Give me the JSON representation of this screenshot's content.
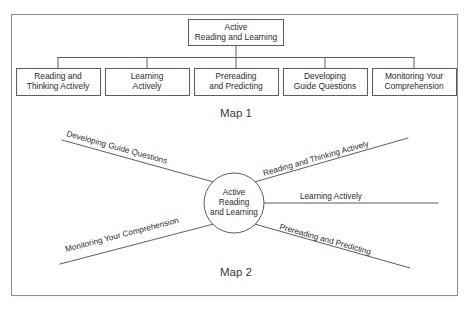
{
  "figure": {
    "background_color": "#ffffff",
    "line_color": "#5d5d5d",
    "frame_color": "#8f8f8f",
    "text_color": "#2b2b2b"
  },
  "map1": {
    "caption": "Map 1",
    "root": {
      "line1": "Active",
      "line2": "Reading and Learning"
    },
    "children": [
      {
        "line1": "Reading and",
        "line2": "Thinking Actively"
      },
      {
        "line1": "Learning",
        "line2": "Actively"
      },
      {
        "line1": "Prereading",
        "line2": "and Predicting"
      },
      {
        "line1": "Developing",
        "line2": "Guide Questions"
      },
      {
        "line1": "Monitoring Your",
        "line2": "Comprehension"
      }
    ]
  },
  "map2": {
    "caption": "Map 2",
    "hub": {
      "line1": "Active",
      "line2": "Reading",
      "line3": "and Learning"
    },
    "spokes": [
      {
        "label": "Developing Guide Questions",
        "position": "upper-left"
      },
      {
        "label": "Reading and Thinking Actively",
        "position": "upper-right"
      },
      {
        "label": "Learning Actively",
        "position": "right"
      },
      {
        "label": "Prereading and Predicting",
        "position": "lower-right"
      },
      {
        "label": "Monitoring Your Comprehension",
        "position": "lower-left"
      }
    ]
  }
}
